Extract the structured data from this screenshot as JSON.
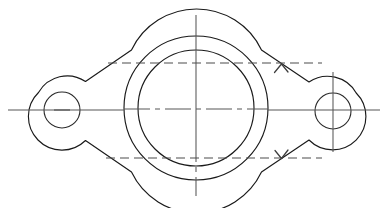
{
  "drawing": {
    "title": "Two-bolt oval flange gasket — orthographic top view",
    "type": "engineering-line-drawing",
    "canvas": {
      "width": 388,
      "height": 208,
      "background": "#ffffff"
    },
    "line_color": "#1a1a1a",
    "centerline_color": "#565656",
    "section_color": "#4c4c4c",
    "body": {
      "name": "flange-body-outline",
      "shape": "obround-diamond",
      "left_lobe_center_x": 62,
      "right_lobe_center_x": 333,
      "lobe_outer_radius": 33,
      "center_boss_radius": 72,
      "center_x": 196,
      "center_y": 108
    },
    "center_circles": {
      "outer": {
        "name": "boss-outer-circle",
        "cx": 196,
        "cy": 108,
        "r": 72
      },
      "inner": {
        "name": "bore-inner-circle",
        "cx": 196,
        "cy": 108,
        "r": 58
      }
    },
    "bolt_holes": [
      {
        "name": "left-bolt-hole",
        "cx": 62,
        "cy": 110,
        "r": 18
      },
      {
        "name": "right-bolt-hole",
        "cx": 333,
        "cy": 111,
        "r": 18
      }
    ],
    "centerlines": {
      "horizontal": {
        "y": 110,
        "x1": 8,
        "x2": 380
      },
      "vertical_main": {
        "x": 196,
        "y1": 15,
        "y2": 196
      },
      "right_hole_vertical": {
        "x": 333,
        "y1": 72,
        "y2": 152
      },
      "left_hole_tick": {
        "y": 110,
        "x1": 54,
        "x2": 70
      }
    },
    "section": {
      "label": "A-A",
      "top_line": {
        "y": 63,
        "x1": 108,
        "x2": 322
      },
      "bottom_line": {
        "y": 158,
        "x1": 106,
        "x2": 322
      },
      "top_arrow": {
        "name": "section-arrow-up",
        "x": 281,
        "y": 67,
        "direction": "up"
      },
      "bottom_arrow": {
        "name": "section-arrow-down",
        "x": 281,
        "y": 155,
        "direction": "down"
      }
    }
  }
}
